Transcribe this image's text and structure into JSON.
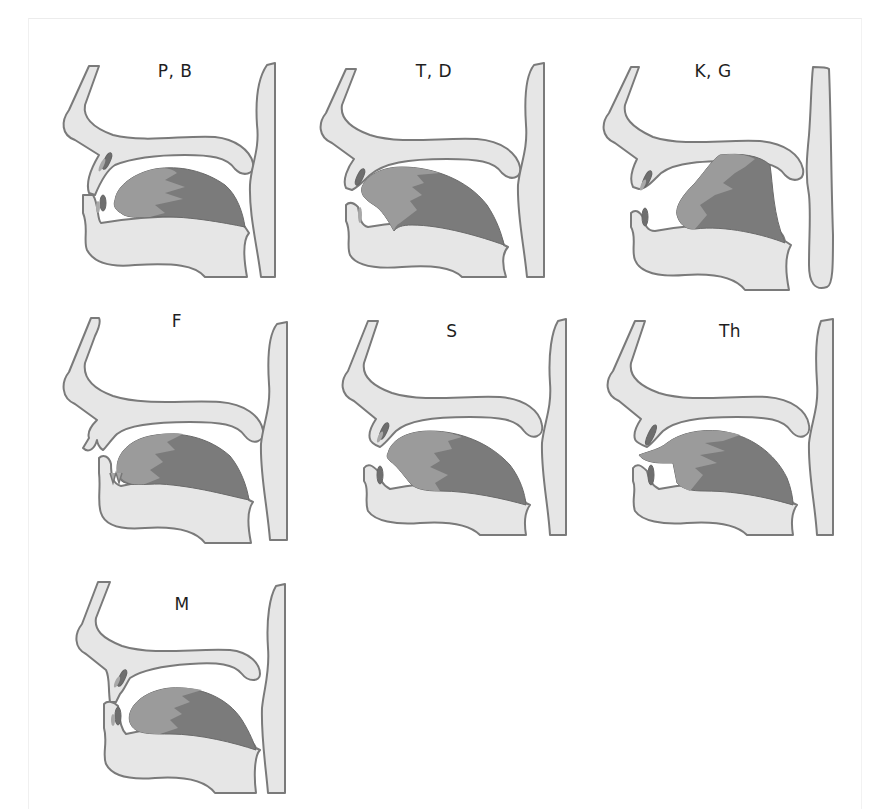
{
  "figure": {
    "type": "articulation-diagram",
    "colors": {
      "tissue_fill": "#e6e6e6",
      "outline": "#7a7a7a",
      "tongue_dark": "#7b7b7b",
      "tongue_light": "#9b9b9b",
      "background": "#ffffff"
    }
  },
  "panels": [
    {
      "id": "pb",
      "label": "P, B",
      "articulation": "bilabial"
    },
    {
      "id": "td",
      "label": "T, D",
      "articulation": "alveolar"
    },
    {
      "id": "kg",
      "label": "K, G",
      "articulation": "velar"
    },
    {
      "id": "f",
      "label": "F",
      "articulation": "labiodental"
    },
    {
      "id": "s",
      "label": "S",
      "articulation": "alveolar-fricative"
    },
    {
      "id": "th",
      "label": "Th",
      "articulation": "dental"
    },
    {
      "id": "m",
      "label": "M",
      "articulation": "bilabial-nasal"
    }
  ]
}
